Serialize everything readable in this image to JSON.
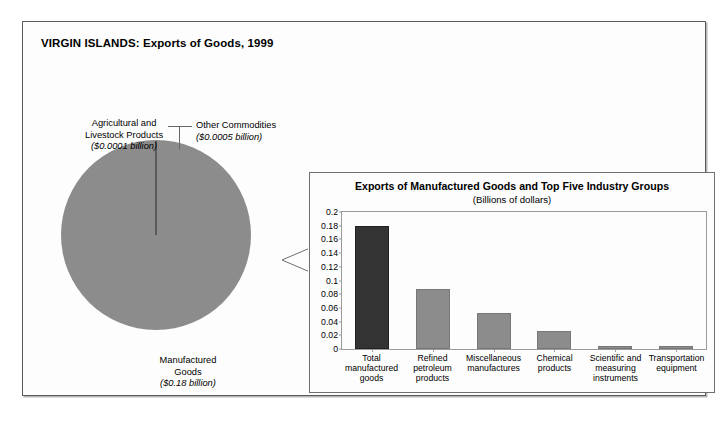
{
  "figure": {
    "title": "VIRGIN ISLANDS: Exports of Goods, 1999"
  },
  "pie": {
    "labels": {
      "agricultural": {
        "line1": "Agricultural and",
        "line2": "Livestock Products",
        "value": "($0.0001 billion)"
      },
      "other": {
        "line1": "Other Commodities",
        "value": "($0.0005 billion)"
      },
      "manufactured": {
        "line1": "Manufactured",
        "line2": "Goods",
        "value": "($0.18 billion)"
      }
    }
  },
  "inset": {
    "title": "Exports of Manufactured Goods and Top Five Industry Groups",
    "subtitle": "(Billions of dollars)"
  },
  "chart_data": [
    {
      "type": "pie",
      "title": "VIRGIN ISLANDS: Exports of Goods, 1999",
      "unit": "billions of dollars",
      "labels": [
        "Manufactured Goods",
        "Other Commodities",
        "Agricultural and Livestock Products"
      ],
      "values": [
        0.18,
        0.0005,
        0.0001
      ],
      "value_labels": [
        "($0.18 billion)",
        "($0.0005 billion)",
        "($0.0001 billion)"
      ],
      "colors": [
        "#8c8c8c",
        "#5a5a5a",
        "#5a5a5a"
      ],
      "legend": "none",
      "annotations": [
        "Tiny non-manufactured slices shown as a thin sliver at 12 o'clock"
      ]
    },
    {
      "type": "bar",
      "title": "Exports of Manufactured Goods and Top Five Industry Groups",
      "subtitle": "(Billions of dollars)",
      "categories": [
        "Total manufactured goods",
        "Refined petroleum products",
        "Miscellaneous manufactures",
        "Chemical products",
        "Scientific and measuring instruments",
        "Transportation equipment"
      ],
      "category_lines": [
        [
          "Total",
          "manufactured",
          "goods"
        ],
        [
          "Refined",
          "petroleum",
          "products"
        ],
        [
          "Miscellaneous",
          "manufactures"
        ],
        [
          "Chemical",
          "products"
        ],
        [
          "Scientific and",
          "measuring",
          "instruments"
        ],
        [
          "Transportation",
          "equipment"
        ]
      ],
      "values": [
        0.18,
        0.088,
        0.052,
        0.027,
        0.004,
        0.004
      ],
      "colors": [
        "#333333",
        "#8c8c8c",
        "#8c8c8c",
        "#8c8c8c",
        "#8c8c8c",
        "#8c8c8c"
      ],
      "xlabel": "",
      "ylabel": "",
      "ylim": [
        0,
        0.2
      ],
      "yticks": [
        0,
        0.02,
        0.04,
        0.06,
        0.08,
        0.1,
        0.12,
        0.14,
        0.16,
        0.18,
        0.2
      ],
      "ytick_labels": [
        "0",
        "0.02",
        "0.04",
        "0.06",
        "0.08",
        "0.1",
        "0.12",
        "0.14",
        "0.16",
        "0.18",
        "0.2"
      ],
      "grid": false,
      "legend": "none"
    }
  ]
}
